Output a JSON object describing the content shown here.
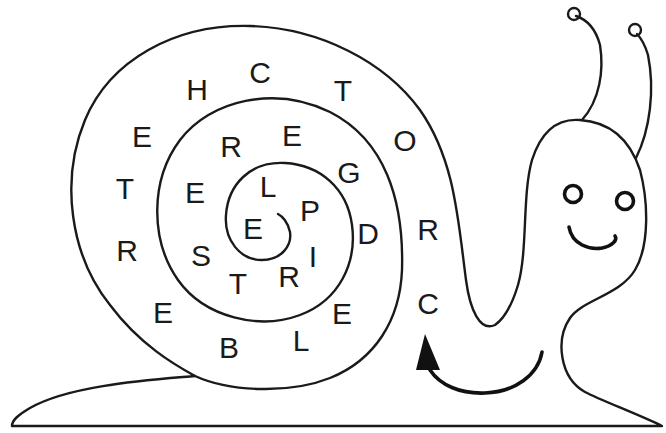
{
  "puzzle": {
    "type": "snail letter spiral",
    "reading_direction": "follow arrow, spiral inward",
    "letters": [
      {
        "char": "C",
        "x": 428,
        "y": 303
      },
      {
        "char": "R",
        "x": 428,
        "y": 229
      },
      {
        "char": "O",
        "x": 405,
        "y": 140
      },
      {
        "char": "T",
        "x": 343,
        "y": 90
      },
      {
        "char": "C",
        "x": 260,
        "y": 72
      },
      {
        "char": "H",
        "x": 197,
        "y": 89
      },
      {
        "char": "E",
        "x": 142,
        "y": 136
      },
      {
        "char": "T",
        "x": 125,
        "y": 188
      },
      {
        "char": "R",
        "x": 127,
        "y": 250
      },
      {
        "char": "E",
        "x": 163,
        "y": 312
      },
      {
        "char": "B",
        "x": 229,
        "y": 347
      },
      {
        "char": "L",
        "x": 301,
        "y": 340
      },
      {
        "char": "E",
        "x": 342,
        "y": 313
      },
      {
        "char": "D",
        "x": 368,
        "y": 233
      },
      {
        "char": "G",
        "x": 349,
        "y": 172
      },
      {
        "char": "E",
        "x": 292,
        "y": 135
      },
      {
        "char": "R",
        "x": 231,
        "y": 146
      },
      {
        "char": "E",
        "x": 195,
        "y": 192
      },
      {
        "char": "S",
        "x": 201,
        "y": 255
      },
      {
        "char": "T",
        "x": 238,
        "y": 283
      },
      {
        "char": "R",
        "x": 289,
        "y": 276
      },
      {
        "char": "I",
        "x": 313,
        "y": 256
      },
      {
        "char": "P",
        "x": 310,
        "y": 210
      },
      {
        "char": "L",
        "x": 268,
        "y": 186
      },
      {
        "char": "E",
        "x": 253,
        "y": 228
      }
    ],
    "sequence": "CROTCHETREBLEDGERESTRIPLE"
  },
  "figure": {
    "stroke_color": "#1a1a1a",
    "background": "#ffffff",
    "parts": [
      "shell-spiral",
      "body-foot",
      "head",
      "left-antenna",
      "right-antenna",
      "left-eye",
      "right-eye",
      "smile",
      "direction-arrow"
    ]
  }
}
